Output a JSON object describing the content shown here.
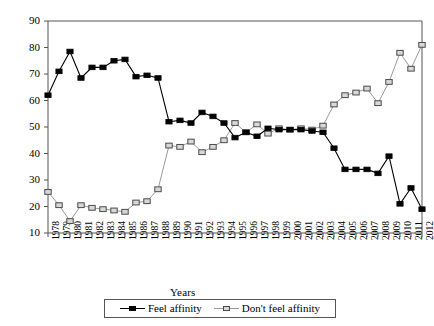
{
  "chart_data": {
    "type": "line",
    "title": "",
    "xlabel": "Years",
    "ylabel": "Percentage",
    "ylim": [
      10,
      90
    ],
    "ytick_step": 10,
    "grid": false,
    "legend_position": "bottom",
    "x": [
      "1978",
      "1979",
      "1980",
      "1981",
      "1982",
      "1983",
      "1984",
      "1985",
      "1986",
      "1987",
      "1988",
      "1989",
      "1990",
      "1991",
      "1992",
      "1993",
      "1994",
      "1995",
      "1996",
      "1997",
      "1998",
      "1999",
      "2000",
      "2001",
      "2002",
      "2003",
      "2004",
      "2005",
      "2006",
      "2007",
      "2008",
      "2009",
      "2010",
      "2011",
      "2012"
    ],
    "ytick_labels": [
      "10",
      "20",
      "30",
      "40",
      "50",
      "60",
      "70",
      "80",
      "90"
    ],
    "series": [
      {
        "name": "Feel affinity",
        "color": "#000000",
        "marker": "filled-square",
        "values": [
          62,
          71,
          78.5,
          68.5,
          72.5,
          72.5,
          75,
          75.5,
          69,
          69.5,
          68.5,
          52,
          52.5,
          51.5,
          55.5,
          54,
          51.5,
          46,
          48,
          46.5,
          49.5,
          49,
          49,
          49,
          48.5,
          48,
          42,
          34,
          34,
          34,
          32.5,
          39,
          21,
          27,
          19
        ]
      },
      {
        "name": "Don't feel affinity",
        "color": "#9a9a9a",
        "marker": "hollow-square",
        "values": [
          25.5,
          20.5,
          14.5,
          20.5,
          19.5,
          19,
          18.5,
          18,
          21.5,
          22,
          26.5,
          43,
          42.5,
          44.5,
          40.5,
          42.5,
          45,
          51.5,
          48,
          51,
          47.5,
          49.5,
          49,
          49.5,
          49,
          50.5,
          58.5,
          62,
          63,
          64.5,
          59,
          67,
          78,
          72,
          81
        ]
      }
    ]
  },
  "legend": {
    "items": [
      {
        "label": "Feel affinity",
        "marker": "filled-square"
      },
      {
        "label": "Don't feel affinity",
        "marker": "hollow-square"
      }
    ]
  },
  "colors": {
    "series_dark": "#000000",
    "series_light": "#9a9a9a",
    "axis": "#555555",
    "background": "#ffffff"
  }
}
